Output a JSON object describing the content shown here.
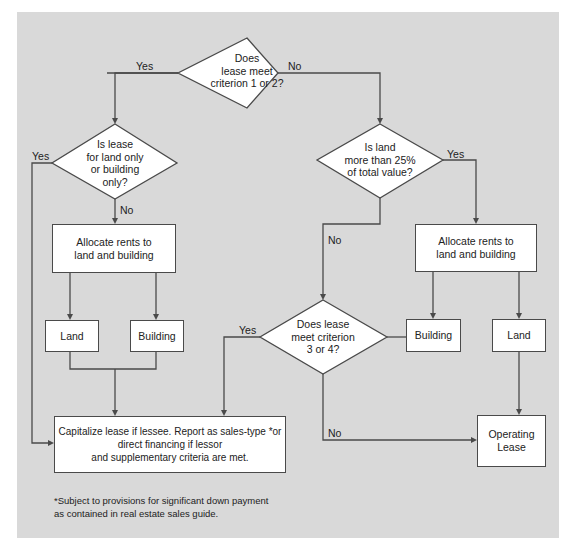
{
  "diagram": {
    "type": "flowchart",
    "colors": {
      "background_panel": "#d9d9d9",
      "shape_fill": "#ffffff",
      "stroke": "#4a4a4a",
      "text": "#222222"
    },
    "decisions": {
      "criterion_1_2": "Does\nlease meet\ncriterion 1 or 2?",
      "land_or_building_only": "Is lease\nfor land only\nor building\nonly?",
      "land_over_25": "Is land\nmore than 25%\nof total value?",
      "criterion_3_4": "Does lease\nmeet criterion\n3 or 4?"
    },
    "boxes": {
      "allocate_left": "Allocate rents to\nland and building",
      "allocate_right": "Allocate rents to\nland and building",
      "land_left": "Land",
      "building_left": "Building",
      "building_right": "Building",
      "land_right": "Land",
      "capitalize": "Capitalize lease if lessee. Report as sales-type *or\ndirect financing if lessor\nand supplementary criteria are met.",
      "operating_lease": "Operating\nLease"
    },
    "edge_labels": {
      "c12_yes": "Yes",
      "c12_no": "No",
      "lb_yes": "Yes",
      "lb_no": "No",
      "l25_yes": "Yes",
      "l25_no": "No",
      "c34_yes": "Yes",
      "c34_no": "No"
    },
    "footnote": "*Subject to provisions for significant down payment\n  as contained in real estate sales guide."
  }
}
